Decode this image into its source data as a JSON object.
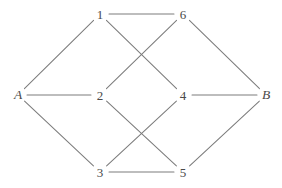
{
  "diagram": {
    "width": 282,
    "height": 188,
    "background_color": "#ffffff",
    "edge_color": "#7c7c7c",
    "label_color": "#4a4a4a"
  },
  "chart_data": {
    "type": "diagram",
    "graph_type": "undirected",
    "title": "",
    "node_count": 8,
    "edge_count": 12,
    "nodes": [
      {
        "id": "A",
        "label": "A",
        "x": 18,
        "y": 95,
        "kind": "terminal"
      },
      {
        "id": "1",
        "label": "1",
        "x": 100,
        "y": 14,
        "kind": "numeric"
      },
      {
        "id": "6",
        "label": "6",
        "x": 183,
        "y": 14,
        "kind": "numeric"
      },
      {
        "id": "2",
        "label": "2",
        "x": 100,
        "y": 95,
        "kind": "numeric"
      },
      {
        "id": "4",
        "label": "4",
        "x": 183,
        "y": 95,
        "kind": "numeric"
      },
      {
        "id": "B",
        "label": "B",
        "x": 266,
        "y": 95,
        "kind": "terminal"
      },
      {
        "id": "3",
        "label": "3",
        "x": 100,
        "y": 172,
        "kind": "numeric"
      },
      {
        "id": "5",
        "label": "5",
        "x": 183,
        "y": 172,
        "kind": "numeric"
      }
    ],
    "edges": [
      {
        "source": "A",
        "target": "1"
      },
      {
        "source": "A",
        "target": "2"
      },
      {
        "source": "A",
        "target": "3"
      },
      {
        "source": "1",
        "target": "6"
      },
      {
        "source": "1",
        "target": "4"
      },
      {
        "source": "6",
        "target": "2"
      },
      {
        "source": "2",
        "target": "5"
      },
      {
        "source": "4",
        "target": "3"
      },
      {
        "source": "3",
        "target": "5"
      },
      {
        "source": "6",
        "target": "B"
      },
      {
        "source": "4",
        "target": "B"
      },
      {
        "source": "5",
        "target": "B"
      }
    ]
  }
}
